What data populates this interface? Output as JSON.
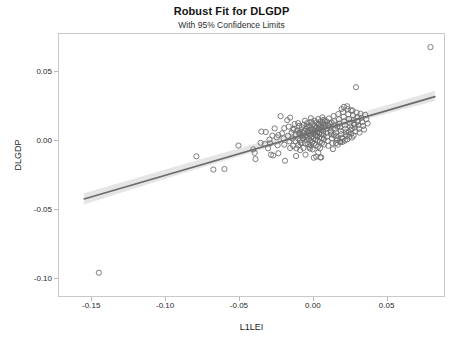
{
  "chart_data": {
    "type": "scatter",
    "title": "Robust Fit for DLGDP",
    "subtitle": "With 95% Confidence Limits",
    "xlabel": "L1LEI",
    "ylabel": "DLGDP",
    "xlim": [
      -0.1725,
      0.0895
    ],
    "ylim": [
      -0.1135,
      0.0775
    ],
    "xticks": [
      -0.15,
      -0.1,
      -0.05,
      0.0,
      0.05
    ],
    "xticklabels": [
      "-0.15",
      "-0.10",
      "-0.05",
      "0.00",
      "0.05"
    ],
    "yticks": [
      0.05,
      0.0,
      -0.05,
      -0.1
    ],
    "yticklabels": [
      "0.05",
      "0.00",
      "-0.05",
      "-0.10"
    ],
    "grid": false,
    "legend": "none",
    "marker": {
      "style": "open-circle",
      "radius": 2.6,
      "stroke": "#6e6e6e",
      "stroke_width": 0.9,
      "fill": "none"
    },
    "fit_line": {
      "label": "robust fit",
      "color": "#6b6b6b",
      "width": 1.6,
      "x": [
        -0.1555,
        0.082
      ],
      "y": [
        -0.0418,
        0.0322
      ],
      "slope": 0.3116,
      "intercept": 0.00665
    },
    "confidence_band": {
      "label": "95% Confidence Limits",
      "level": 0.95,
      "fill": "#cfcfcf",
      "opacity": 0.55,
      "x": [
        -0.1555,
        -0.12,
        -0.09,
        -0.06,
        -0.03,
        -0.01,
        0.01,
        0.03,
        0.055,
        0.082
      ],
      "upper": [
        -0.0378,
        -0.0266,
        -0.0173,
        -0.0081,
        0.0011,
        0.0073,
        0.0136,
        0.0199,
        0.0278,
        0.0364
      ],
      "lower": [
        -0.0458,
        -0.0337,
        -0.0238,
        -0.014,
        -0.0044,
        0.0019,
        0.0081,
        0.0142,
        0.0215,
        0.0291
      ]
    },
    "points": [
      [
        -0.1455,
        -0.0952
      ],
      [
        -0.0795,
        -0.011
      ],
      [
        -0.068,
        -0.0206
      ],
      [
        -0.0605,
        -0.0202
      ],
      [
        -0.051,
        -0.0032
      ],
      [
        -0.041,
        -0.006
      ],
      [
        -0.04,
        -0.0085
      ],
      [
        -0.0395,
        -0.013
      ],
      [
        -0.0355,
        0.0069
      ],
      [
        -0.033,
        -0.0022
      ],
      [
        -0.0325,
        0.0066
      ],
      [
        -0.03,
        0.0011
      ],
      [
        -0.0295,
        -0.0016
      ],
      [
        -0.029,
        -0.0098
      ],
      [
        -0.0275,
        -0.0104
      ],
      [
        -0.0265,
        0.0092
      ],
      [
        -0.025,
        0.0027
      ],
      [
        -0.0245,
        -0.003
      ],
      [
        -0.024,
        -0.0088
      ],
      [
        -0.0225,
        0.018
      ],
      [
        -0.0215,
        0.0056
      ],
      [
        -0.0205,
        0.002
      ],
      [
        -0.02,
        -0.0025
      ],
      [
        -0.0195,
        -0.0142
      ],
      [
        -0.018,
        0.0152
      ],
      [
        -0.0175,
        0.0038
      ],
      [
        -0.017,
        0.0105
      ],
      [
        -0.0165,
        -0.0002
      ],
      [
        -0.016,
        0.017
      ],
      [
        -0.015,
        0.0062
      ],
      [
        -0.0145,
        0.0018
      ],
      [
        -0.014,
        -0.0034
      ],
      [
        -0.0135,
        0.009
      ],
      [
        -0.013,
        0.0124
      ],
      [
        -0.0125,
        0.0001
      ],
      [
        -0.012,
        0.0047
      ],
      [
        -0.0118,
        -0.0052
      ],
      [
        -0.0112,
        0.0076
      ],
      [
        -0.0108,
        0.002
      ],
      [
        -0.0105,
        -0.003
      ],
      [
        -0.01,
        0.011
      ],
      [
        -0.0098,
        0.0055
      ],
      [
        -0.0095,
        0.0005
      ],
      [
        -0.0092,
        -0.0065
      ],
      [
        -0.009,
        0.008
      ],
      [
        -0.0086,
        0.0038
      ],
      [
        -0.0082,
        -0.0014
      ],
      [
        -0.008,
        0.01
      ],
      [
        -0.0076,
        0.0062
      ],
      [
        -0.0072,
        0.0022
      ],
      [
        -0.007,
        -0.005
      ],
      [
        -0.0068,
        0.0118
      ],
      [
        -0.0064,
        0.0072
      ],
      [
        -0.006,
        0.003
      ],
      [
        -0.0058,
        -0.0016
      ],
      [
        -0.0056,
        -0.0098
      ],
      [
        -0.0052,
        0.0088
      ],
      [
        -0.005,
        0.0044
      ],
      [
        -0.0048,
        0.0008
      ],
      [
        -0.0045,
        0.013
      ],
      [
        -0.0042,
        0.0068
      ],
      [
        -0.004,
        0.0026
      ],
      [
        -0.0038,
        -0.0022
      ],
      [
        -0.0036,
        0.0102
      ],
      [
        -0.0034,
        0.0058
      ],
      [
        -0.0032,
        0.0014
      ],
      [
        -0.003,
        -0.0042
      ],
      [
        -0.0028,
        0.0112
      ],
      [
        -0.0026,
        0.008
      ],
      [
        -0.0024,
        0.0046
      ],
      [
        -0.0022,
        0.0006
      ],
      [
        -0.002,
        -0.003
      ],
      [
        -0.0018,
        0.014
      ],
      [
        -0.0016,
        0.0094
      ],
      [
        -0.0014,
        0.0064
      ],
      [
        -0.0012,
        0.003
      ],
      [
        -0.001,
        -0.0008
      ],
      [
        -0.0008,
        -0.006
      ],
      [
        -0.0006,
        0.0124
      ],
      [
        -0.0004,
        0.0086
      ],
      [
        -0.0002,
        0.0052
      ],
      [
        0.0,
        0.0018
      ],
      [
        0.0002,
        -0.0018
      ],
      [
        0.0004,
        0.0148
      ],
      [
        0.0006,
        0.0106
      ],
      [
        0.0008,
        0.0074
      ],
      [
        0.001,
        0.0042
      ],
      [
        0.0012,
        0.001
      ],
      [
        0.0014,
        -0.0028
      ],
      [
        0.0016,
        -0.0112
      ],
      [
        0.0018,
        0.0136
      ],
      [
        0.002,
        0.0098
      ],
      [
        0.0022,
        0.0066
      ],
      [
        0.0024,
        0.0036
      ],
      [
        0.0026,
        0.0004
      ],
      [
        0.0028,
        -0.004
      ],
      [
        0.003,
        0.016
      ],
      [
        0.0032,
        0.0118
      ],
      [
        0.0034,
        0.0088
      ],
      [
        0.0036,
        0.0058
      ],
      [
        0.0038,
        0.0028
      ],
      [
        0.004,
        -0.0004
      ],
      [
        0.0042,
        -0.0052
      ],
      [
        0.0044,
        -0.0118
      ],
      [
        0.0046,
        0.0142
      ],
      [
        0.0048,
        0.0108
      ],
      [
        0.005,
        0.008
      ],
      [
        0.0052,
        0.005
      ],
      [
        0.0054,
        0.0022
      ],
      [
        0.0056,
        -0.0012
      ],
      [
        0.0058,
        0.0172
      ],
      [
        0.006,
        0.013
      ],
      [
        0.0062,
        0.0098
      ],
      [
        0.0064,
        0.007
      ],
      [
        0.0066,
        0.0042
      ],
      [
        0.0068,
        0.0014
      ],
      [
        0.007,
        -0.0024
      ],
      [
        0.0074,
        0.015
      ],
      [
        0.0078,
        0.0116
      ],
      [
        0.0082,
        0.0086
      ],
      [
        0.0086,
        0.006
      ],
      [
        0.009,
        0.0032
      ],
      [
        0.0094,
        0.0002
      ],
      [
        0.0098,
        -0.0034
      ],
      [
        0.0102,
        0.0164
      ],
      [
        0.0106,
        0.0128
      ],
      [
        0.011,
        0.01
      ],
      [
        0.0114,
        0.0074
      ],
      [
        0.0118,
        0.0048
      ],
      [
        0.0122,
        0.002
      ],
      [
        0.0126,
        -0.0014
      ],
      [
        0.013,
        -0.0058
      ],
      [
        0.0134,
        0.0182
      ],
      [
        0.0138,
        0.0144
      ],
      [
        0.0142,
        0.0114
      ],
      [
        0.0146,
        0.0088
      ],
      [
        0.015,
        0.0062
      ],
      [
        0.0154,
        0.0036
      ],
      [
        0.0158,
        0.0008
      ],
      [
        0.0162,
        -0.0026
      ],
      [
        0.0166,
        0.0196
      ],
      [
        0.017,
        0.0158
      ],
      [
        0.0174,
        0.0126
      ],
      [
        0.0178,
        0.01
      ],
      [
        0.0182,
        0.0074
      ],
      [
        0.0186,
        0.005
      ],
      [
        0.019,
        0.0024
      ],
      [
        0.0194,
        -0.0006
      ],
      [
        0.0198,
        0.021
      ],
      [
        0.0202,
        0.0176
      ],
      [
        0.0206,
        0.0142
      ],
      [
        0.021,
        0.0114
      ],
      [
        0.0214,
        0.009
      ],
      [
        0.0218,
        0.0064
      ],
      [
        0.0222,
        0.004
      ],
      [
        0.0226,
        0.0012
      ],
      [
        0.023,
        0.0232
      ],
      [
        0.0234,
        0.0194
      ],
      [
        0.0238,
        0.016
      ],
      [
        0.0242,
        0.0132
      ],
      [
        0.0246,
        0.0106
      ],
      [
        0.025,
        0.008
      ],
      [
        0.0254,
        0.0054
      ],
      [
        0.0258,
        0.0026
      ],
      [
        0.0262,
        0.0222
      ],
      [
        0.0266,
        0.0186
      ],
      [
        0.027,
        0.0152
      ],
      [
        0.0274,
        0.0124
      ],
      [
        0.0278,
        0.0098
      ],
      [
        0.0282,
        0.007
      ],
      [
        0.0286,
        0.039
      ],
      [
        0.029,
        0.0206
      ],
      [
        0.0294,
        0.0174
      ],
      [
        0.0298,
        0.0144
      ],
      [
        0.0302,
        0.0116
      ],
      [
        0.0306,
        0.009
      ],
      [
        0.031,
        0.0062
      ],
      [
        0.0316,
        0.0198
      ],
      [
        0.0322,
        0.0168
      ],
      [
        0.0328,
        0.0138
      ],
      [
        0.0334,
        0.011
      ],
      [
        0.034,
        0.0084
      ],
      [
        0.0348,
        0.019
      ],
      [
        0.0356,
        0.0158
      ],
      [
        0.0364,
        0.0128
      ],
      [
        0.079,
        0.068
      ],
      [
        -0.002,
        0.0166
      ],
      [
        -0.006,
        0.0148
      ],
      [
        -0.01,
        0.006
      ],
      [
        -0.014,
        0.0082
      ],
      [
        0.0,
        -0.012
      ],
      [
        0.005,
        -0.0118
      ],
      [
        0.0036,
        0.0124
      ],
      [
        0.0012,
        0.0092
      ],
      [
        -0.0026,
        -0.0054
      ],
      [
        0.015,
        -0.0014
      ],
      [
        0.018,
        -0.0008
      ],
      [
        0.021,
        0.0004
      ],
      [
        0.024,
        0.0032
      ],
      [
        0.027,
        0.004
      ],
      [
        0.016,
        0.0106
      ],
      [
        0.012,
        0.0134
      ],
      [
        0.0088,
        0.0142
      ],
      [
        0.0064,
        0.0152
      ],
      [
        0.003,
        -0.0082
      ],
      [
        -0.012,
        -0.0108
      ],
      [
        -0.016,
        -0.005
      ],
      [
        -0.02,
        0.0094
      ],
      [
        -0.024,
        0.0044
      ],
      [
        -0.028,
        0.004
      ],
      [
        -0.031,
        -0.0052
      ],
      [
        -0.036,
        -0.0012
      ],
      [
        0.0204,
        0.0248
      ],
      [
        0.0188,
        0.0232
      ],
      [
        0.0226,
        0.0252
      ],
      [
        0.0252,
        0.0222
      ],
      [
        0.0008,
        0.006
      ],
      [
        0.0018,
        0.004
      ],
      [
        0.0026,
        0.0068
      ],
      [
        0.0044,
        0.0094
      ],
      [
        0.0072,
        0.0106
      ],
      [
        0.0096,
        0.0118
      ],
      [
        -0.0048,
        0.0108
      ],
      [
        -0.0074,
        0.0042
      ],
      [
        -0.009,
        -0.0012
      ],
      [
        -0.0106,
        0.013
      ],
      [
        0.0116,
        0.0062
      ],
      [
        0.0136,
        0.0044
      ],
      [
        0.0156,
        0.002
      ],
      [
        0.0176,
        -0.0002
      ],
      [
        0.0196,
        0.0016
      ],
      [
        0.0216,
        0.0048
      ],
      [
        0.0236,
        0.0066
      ],
      [
        0.0256,
        0.0092
      ],
      [
        0.0276,
        0.0118
      ],
      [
        0.0296,
        0.014
      ]
    ]
  },
  "meta": {
    "title": "Robust Fit for DLGDP",
    "subtitle": "With 95% Confidence Limits",
    "xlabel": "L1LEI",
    "ylabel": "DLGDP"
  }
}
